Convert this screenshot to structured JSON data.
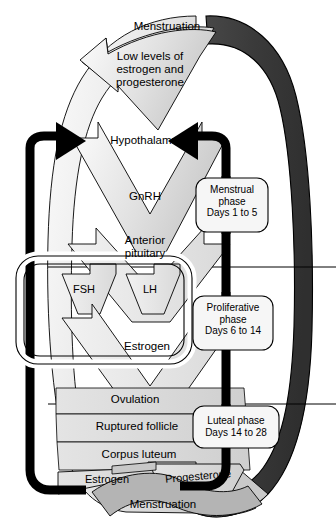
{
  "diagram": {
    "colors": {
      "band_dark": "#3b3b3b",
      "arrow_fill_light": "#efefef",
      "arrow_fill_mid": "#d8d8d8",
      "arrow_fill_dark": "#b9b9b9",
      "outline": "#000000",
      "callout_fill": "#f4f4f4",
      "black": "#000000",
      "background": "#ffffff"
    },
    "flow_steps": [
      {
        "id": "menstruation-top",
        "label": "Menstruation"
      },
      {
        "id": "low-levels",
        "label": "Low levels of\nestrogen and\nprogesterone"
      },
      {
        "id": "hypothalamus",
        "label": "Hypothalamus"
      },
      {
        "id": "gnrh",
        "label": "GnRH"
      },
      {
        "id": "anterior-pituitary",
        "label": "Anterior\npituitary"
      },
      {
        "id": "fsh",
        "label": "FSH"
      },
      {
        "id": "lh",
        "label": "LH"
      },
      {
        "id": "estrogen",
        "label": "Estrogen"
      },
      {
        "id": "ovulation",
        "label": "Ovulation"
      },
      {
        "id": "ruptured-follicle",
        "label": "Ruptured follicle"
      },
      {
        "id": "corpus-luteum",
        "label": "Corpus luteum"
      },
      {
        "id": "estrogen-2",
        "label": "Estrogen"
      },
      {
        "id": "progesterone",
        "label": "Progesterone"
      },
      {
        "id": "menstruation-bottom",
        "label": "Menstruation"
      }
    ],
    "phase_callouts": [
      {
        "id": "menstrual-phase",
        "label": "Menstrual\nphase\nDays 1 to 5"
      },
      {
        "id": "proliferative-phase",
        "label": "Proliferative\nphase\nDays 6 to 14"
      },
      {
        "id": "luteal-phase",
        "label": "Luteal phase\nDays 14 to 28"
      }
    ]
  }
}
